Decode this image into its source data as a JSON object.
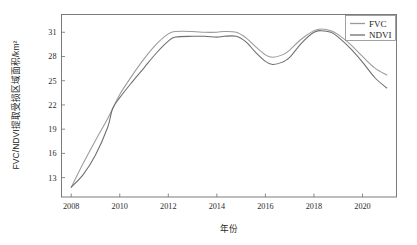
{
  "chart_data": {
    "type": "line",
    "title": "",
    "xlabel": "年份",
    "ylabel": "FVC/NDVI提取受损区域面积/km²",
    "xlim": [
      2007.6,
      2021.4
    ],
    "ylim": [
      10.6,
      33.2
    ],
    "grid": false,
    "legend_position": "top-right",
    "xticks": [
      2008,
      2010,
      2012,
      2014,
      2016,
      2018,
      2020
    ],
    "xtick_labels": [
      "2008",
      "2010",
      "2012",
      "2014",
      "2016",
      "2018",
      "2020"
    ],
    "yticks": [
      13,
      16,
      19,
      22,
      25,
      28,
      31
    ],
    "ytick_labels": [
      "13",
      "16",
      "19",
      "22",
      "25",
      "28",
      "31"
    ],
    "x": [
      2008,
      2008.5,
      2009,
      2009.5,
      2009.7,
      2010,
      2010.5,
      2011,
      2011.5,
      2012,
      2012.3,
      2013,
      2013.5,
      2014,
      2014.3,
      2014.8,
      2015.2,
      2015.6,
      2016,
      2016.3,
      2016.7,
      2017,
      2017.5,
      2018,
      2018.3,
      2018.7,
      2019,
      2019.5,
      2020,
      2020.5,
      2021
    ],
    "series": [
      {
        "name": "FVC",
        "color": "#9a9a9a",
        "values": [
          11.8,
          14.8,
          17.6,
          20.3,
          21.5,
          23.3,
          25.6,
          27.7,
          29.5,
          30.8,
          31.1,
          31.1,
          31.0,
          31.0,
          31.1,
          31.0,
          30.3,
          29.2,
          28.2,
          27.9,
          28.2,
          28.8,
          30.2,
          31.2,
          31.4,
          31.2,
          30.7,
          29.5,
          28.0,
          26.6,
          25.7
        ]
      },
      {
        "name": "NDVI",
        "color": "#6d6d6d",
        "values": [
          11.8,
          13.4,
          15.8,
          19.2,
          21.5,
          22.9,
          24.8,
          26.6,
          28.4,
          29.9,
          30.4,
          30.5,
          30.5,
          30.4,
          30.5,
          30.5,
          29.8,
          28.5,
          27.4,
          27.0,
          27.3,
          27.9,
          29.7,
          31.0,
          31.2,
          31.0,
          30.4,
          29.0,
          27.3,
          25.4,
          24.1
        ]
      }
    ],
    "legend": [
      {
        "label": "FVC",
        "color": "#9a9a9a"
      },
      {
        "label": "NDVI",
        "color": "#6d6d6d"
      }
    ]
  }
}
